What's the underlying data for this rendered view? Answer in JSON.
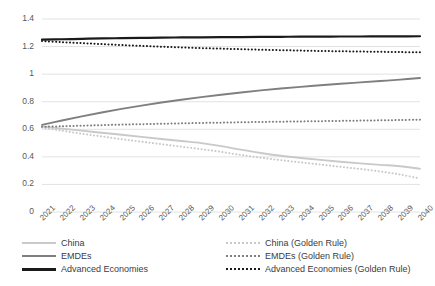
{
  "chart_data": {
    "type": "line",
    "title": "",
    "xlabel": "",
    "ylabel": "",
    "ylim": [
      0,
      1.4
    ],
    "ytick_labels": [
      "0",
      "0.2",
      "0.4",
      "0.6",
      "0.8",
      "1",
      "1.2",
      "1.4"
    ],
    "ytick_values": [
      0,
      0.2,
      0.4,
      0.6,
      0.8,
      1.0,
      1.2,
      1.4
    ],
    "grid": true,
    "grid_axis": "y",
    "legend_position": "bottom",
    "legend_columns": 2,
    "categories": [
      "2021",
      "2022",
      "2023",
      "2024",
      "2025",
      "2026",
      "2027",
      "2028",
      "2029",
      "2030",
      "2031",
      "2032",
      "2033",
      "2034",
      "2035",
      "2036",
      "2037",
      "2038",
      "2039",
      "2040"
    ],
    "x": [
      2021,
      2022,
      2023,
      2024,
      2025,
      2026,
      2027,
      2028,
      2029,
      2030,
      2031,
      2032,
      2033,
      2034,
      2035,
      2036,
      2037,
      2038,
      2039,
      2040
    ],
    "series": [
      {
        "name": "China",
        "style": "solid",
        "color": "#c9c9c9",
        "values": [
          0.62,
          0.605,
          0.59,
          0.575,
          0.56,
          0.545,
          0.53,
          0.515,
          0.5,
          0.478,
          0.452,
          0.428,
          0.408,
          0.392,
          0.378,
          0.365,
          0.353,
          0.342,
          0.332,
          0.313
        ]
      },
      {
        "name": "EMDEs",
        "style": "solid",
        "color": "#7f7f7f",
        "values": [
          0.632,
          0.664,
          0.694,
          0.722,
          0.748,
          0.772,
          0.794,
          0.814,
          0.833,
          0.851,
          0.867,
          0.882,
          0.896,
          0.908,
          0.919,
          0.93,
          0.94,
          0.95,
          0.96,
          0.972
        ]
      },
      {
        "name": "Advanced Economies",
        "style": "solid",
        "color": "#1a1a1a",
        "values": [
          1.25,
          1.253,
          1.256,
          1.259,
          1.261,
          1.263,
          1.265,
          1.266,
          1.267,
          1.268,
          1.269,
          1.27,
          1.271,
          1.272,
          1.272,
          1.273,
          1.273,
          1.274,
          1.274,
          1.275
        ]
      },
      {
        "name": "China (Golden Rule)",
        "style": "dotted",
        "color": "#c9c9c9",
        "values": [
          0.612,
          0.59,
          0.568,
          0.548,
          0.528,
          0.51,
          0.492,
          0.474,
          0.456,
          0.436,
          0.414,
          0.394,
          0.376,
          0.36,
          0.344,
          0.328,
          0.312,
          0.294,
          0.272,
          0.243
        ]
      },
      {
        "name": "EMDEs (Golden Rule)",
        "style": "dotted",
        "color": "#7f7f7f",
        "values": [
          0.618,
          0.622,
          0.626,
          0.63,
          0.634,
          0.637,
          0.64,
          0.643,
          0.646,
          0.648,
          0.651,
          0.653,
          0.655,
          0.657,
          0.659,
          0.661,
          0.663,
          0.665,
          0.667,
          0.67
        ]
      },
      {
        "name": "Advanced Economies (Golden Rule)",
        "style": "dotted",
        "color": "#1a1a1a",
        "values": [
          1.24,
          1.232,
          1.225,
          1.218,
          1.211,
          1.205,
          1.199,
          1.194,
          1.189,
          1.185,
          1.181,
          1.177,
          1.174,
          1.171,
          1.168,
          1.166,
          1.164,
          1.162,
          1.16,
          1.158
        ]
      }
    ]
  },
  "legend": {
    "left_items": [
      {
        "label": "China"
      },
      {
        "label": "EMDEs"
      },
      {
        "label": "Advanced Economies"
      }
    ],
    "right_items": [
      {
        "label": "China (Golden Rule)"
      },
      {
        "label": "EMDEs (Golden Rule)"
      },
      {
        "label": "Advanced Economies (Golden Rule)"
      }
    ]
  },
  "colors": {
    "china": "#c9c9c9",
    "emdes": "#7f7f7f",
    "advanced": "#1a1a1a",
    "grid": "#e2e2e2",
    "tick_text": "#595959"
  }
}
